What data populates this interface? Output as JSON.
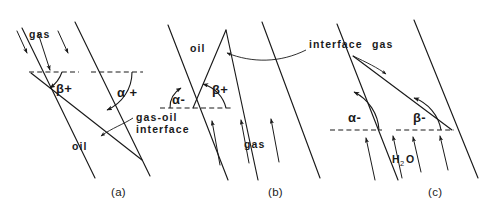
{
  "figure": {
    "background_color": "#ffffff",
    "line_color": "#1a1a1a"
  },
  "panels": [
    {
      "id": "a",
      "caption": "(a)",
      "upper_fluid": "gas",
      "lower_fluid": "oil",
      "flow_direction": "downward",
      "interface_note": "gas-oil interface",
      "angles": [
        {
          "name": "beta-plus",
          "label": "β+",
          "sign": "+"
        },
        {
          "name": "alpha-plus",
          "label": "α +",
          "sign": "+"
        }
      ]
    },
    {
      "id": "b",
      "caption": "(b)",
      "upper_fluid": "oil",
      "lower_fluid": "gas",
      "flow_direction": "upward",
      "interface_note": "interface",
      "angles": [
        {
          "name": "alpha-minus",
          "label": "α-",
          "sign": "-"
        },
        {
          "name": "beta-plus",
          "label": "β+",
          "sign": "+"
        }
      ]
    },
    {
      "id": "c",
      "caption": "(c)",
      "upper_fluid": "gas",
      "lower_fluid_main": "H",
      "lower_fluid_sub": "2",
      "lower_fluid_tail": "O",
      "flow_direction": "upward",
      "angles": [
        {
          "name": "alpha-minus",
          "label": "α-",
          "sign": "-"
        },
        {
          "name": "beta-minus",
          "label": "β-",
          "sign": "-"
        }
      ]
    }
  ],
  "labels": {
    "gas": "gas",
    "oil": "oil",
    "gas_oil_interface_line1": "gas-oil",
    "gas_oil_interface_line2": "interface",
    "interface": "interface",
    "water_main": "H",
    "water_sub": "2",
    "water_tail": "O",
    "alpha_plus": "α +",
    "alpha_minus": "α-",
    "beta_plus": "β+",
    "beta_minus": "β-",
    "panel_a": "(a)",
    "panel_b": "(b)",
    "panel_c": "(c)"
  }
}
